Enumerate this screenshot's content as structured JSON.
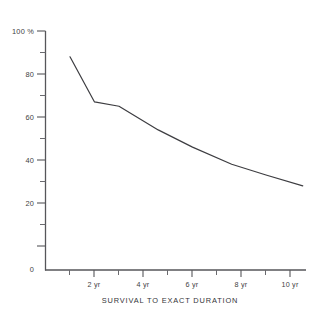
{
  "chart_data": {
    "type": "line",
    "title": "",
    "xlabel": "SURVIVAL TO EXACT DURATION",
    "ylabel": "",
    "y_axis_top_label": "100 %",
    "xlim": [
      0,
      11
    ],
    "ylim": [
      0,
      100
    ],
    "grid": false,
    "legend": "none",
    "y_ticks_major": [
      0,
      20,
      40,
      60,
      80,
      100
    ],
    "y_tick_labels": [
      "0",
      "20",
      "40",
      "60",
      "80",
      "100 %"
    ],
    "y_ticks_minor": [
      10,
      30,
      50,
      70,
      90
    ],
    "x_ticks_major": [
      2,
      4,
      6,
      8,
      10
    ],
    "x_tick_labels": [
      "2 yr",
      "4 yr",
      "6 yr",
      "8 yr",
      "10 yr"
    ],
    "x_ticks_minor": [
      1,
      3,
      5,
      7,
      9,
      11
    ],
    "series": [
      {
        "name": "Survival",
        "x": [
          1.0,
          2.0,
          3.0,
          4.6,
          6.0,
          7.6,
          9.0,
          10.5
        ],
        "values": [
          88,
          67,
          65,
          54,
          46,
          38,
          33,
          28
        ]
      }
    ]
  },
  "axis": {
    "y_labels": [
      {
        "text": "100 %",
        "value": 100
      },
      {
        "text": "80",
        "value": 80
      },
      {
        "text": "60",
        "value": 60
      },
      {
        "text": "40",
        "value": 40
      },
      {
        "text": "20",
        "value": 20
      },
      {
        "text": "0",
        "value": 0
      }
    ],
    "x_labels": [
      {
        "text": "2 yr",
        "value": 2
      },
      {
        "text": "4 yr",
        "value": 4
      },
      {
        "text": "6 yr",
        "value": 6
      },
      {
        "text": "8 yr",
        "value": 8
      },
      {
        "text": "10 yr",
        "value": 10
      }
    ]
  },
  "caption": {
    "x_axis_title": "SURVIVAL TO EXACT DURATION"
  },
  "colors": {
    "line": "#3d3d41",
    "axis": "#56565a",
    "text": "#3f3f43",
    "background": "#ffffff"
  }
}
